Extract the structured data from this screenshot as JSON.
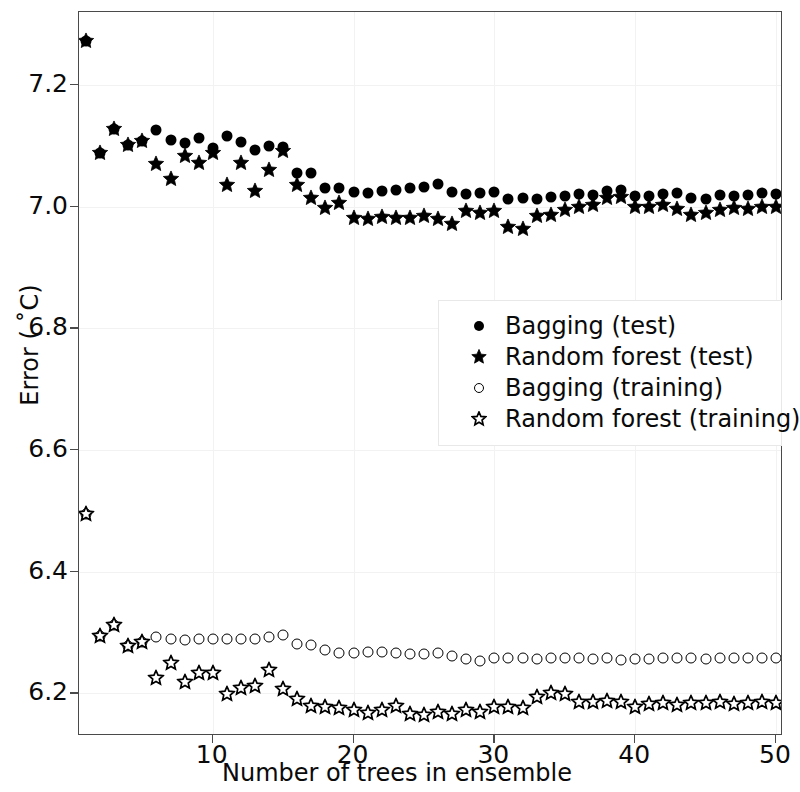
{
  "chart_data": {
    "type": "scatter",
    "title": "",
    "xlabel": "Number of trees in ensemble",
    "ylabel": "Error ( ˚C)",
    "xlim": [
      0.5,
      50.5
    ],
    "ylim": [
      6.13,
      7.32
    ],
    "xticks": [
      10,
      20,
      30,
      40,
      50
    ],
    "yticks": [
      6.2,
      6.4,
      6.6,
      6.8,
      7.0,
      7.2
    ],
    "ytick_labels": [
      "6.2",
      "6.4",
      "6.6",
      "6.8",
      "7.0",
      "7.2"
    ],
    "xtick_labels": [
      "10",
      "20",
      "30",
      "40",
      "50"
    ],
    "grid": true,
    "legend_position": "center-right",
    "x": [
      1,
      2,
      3,
      4,
      5,
      6,
      7,
      8,
      9,
      10,
      11,
      12,
      13,
      14,
      15,
      16,
      17,
      18,
      19,
      20,
      21,
      22,
      23,
      24,
      25,
      26,
      27,
      28,
      29,
      30,
      31,
      32,
      33,
      34,
      35,
      36,
      37,
      38,
      39,
      40,
      41,
      42,
      43,
      44,
      45,
      46,
      47,
      48,
      49,
      50
    ],
    "series": [
      {
        "name": "Bagging (test)",
        "marker": "filled-circle",
        "values": [
          7.272,
          7.089,
          7.128,
          7.102,
          7.108,
          7.126,
          7.109,
          7.105,
          7.113,
          7.097,
          7.117,
          7.107,
          7.093,
          7.1,
          7.098,
          7.055,
          7.056,
          7.03,
          7.031,
          7.024,
          7.023,
          7.026,
          7.028,
          7.031,
          7.033,
          7.037,
          7.024,
          7.021,
          7.023,
          7.024,
          7.012,
          7.014,
          7.012,
          7.016,
          7.018,
          7.021,
          7.019,
          7.026,
          7.028,
          7.017,
          7.017,
          7.021,
          7.023,
          7.015,
          7.013,
          7.019,
          7.018,
          7.02,
          7.022,
          7.021
        ]
      },
      {
        "name": "Random forest (test)",
        "marker": "filled-star",
        "values": [
          7.272,
          7.089,
          7.128,
          7.102,
          7.108,
          7.07,
          7.045,
          7.084,
          7.072,
          7.089,
          7.036,
          7.071,
          7.026,
          7.06,
          7.091,
          7.036,
          7.015,
          6.998,
          7.006,
          6.981,
          6.98,
          6.983,
          6.982,
          6.982,
          6.985,
          6.98,
          6.971,
          6.993,
          6.99,
          6.993,
          6.966,
          6.964,
          6.984,
          6.986,
          6.994,
          6.999,
          7.002,
          7.015,
          7.016,
          7.0,
          6.999,
          7.002,
          6.996,
          6.987,
          6.99,
          6.995,
          6.998,
          6.996,
          6.999,
          7.0
        ]
      },
      {
        "name": "Bagging (training)",
        "marker": "open-circle",
        "values": [
          6.495,
          6.294,
          6.312,
          6.278,
          6.285,
          6.292,
          6.29,
          6.288,
          6.29,
          6.29,
          6.289,
          6.289,
          6.29,
          6.292,
          6.296,
          6.282,
          6.28,
          6.272,
          6.267,
          6.266,
          6.268,
          6.268,
          6.266,
          6.264,
          6.265,
          6.266,
          6.262,
          6.257,
          6.253,
          6.259,
          6.258,
          6.258,
          6.257,
          6.258,
          6.258,
          6.258,
          6.257,
          6.259,
          6.255,
          6.257,
          6.257,
          6.258,
          6.258,
          6.258,
          6.257,
          6.258,
          6.258,
          6.258,
          6.259,
          6.258
        ]
      },
      {
        "name": "Random forest (training)",
        "marker": "open-star",
        "values": [
          6.495,
          6.294,
          6.312,
          6.278,
          6.285,
          6.226,
          6.25,
          6.219,
          6.234,
          6.234,
          6.199,
          6.209,
          6.212,
          6.238,
          6.208,
          6.19,
          6.179,
          6.178,
          6.176,
          6.172,
          6.168,
          6.172,
          6.179,
          6.166,
          6.164,
          6.17,
          6.166,
          6.172,
          6.17,
          6.178,
          6.178,
          6.176,
          6.194,
          6.2,
          6.199,
          6.186,
          6.186,
          6.188,
          6.186,
          6.178,
          6.182,
          6.184,
          6.181,
          6.184,
          6.185,
          6.186,
          6.182,
          6.184,
          6.186,
          6.185
        ]
      }
    ]
  },
  "legend": {
    "items": [
      {
        "label": "Bagging (test)",
        "marker": "filled-circle"
      },
      {
        "label": "Random forest (test)",
        "marker": "filled-star"
      },
      {
        "label": "Bagging (training)",
        "marker": "open-circle"
      },
      {
        "label": "Random forest (training)",
        "marker": "open-star"
      }
    ]
  }
}
